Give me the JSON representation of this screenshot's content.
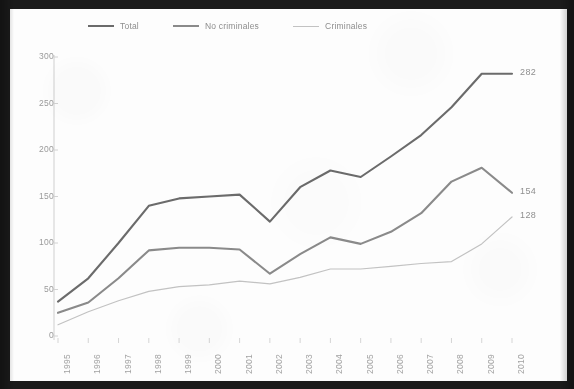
{
  "chart_data": {
    "type": "line",
    "title": "",
    "subtitle": "",
    "xlabel": "",
    "ylabel": "",
    "xlim": [
      1995,
      2010
    ],
    "ylim": [
      0,
      300
    ],
    "yticks": [
      0,
      50,
      100,
      150,
      200,
      250,
      300
    ],
    "grid": false,
    "legend_position": "top",
    "categories": [
      "1995",
      "1996",
      "1997",
      "1998",
      "1999",
      "2000",
      "2001",
      "2002",
      "2003",
      "2004",
      "2005",
      "2006",
      "2007",
      "2008",
      "2009",
      "2010"
    ],
    "series": [
      {
        "name": "Total",
        "color": "#6b6b6b",
        "end_label": "282",
        "values": [
          37,
          62,
          100,
          140,
          148,
          150,
          152,
          123,
          160,
          178,
          171,
          193,
          216,
          246,
          282,
          282
        ]
      },
      {
        "name": "No criminales",
        "color": "#8a8a8a",
        "end_label": "154",
        "values": [
          25,
          36,
          62,
          92,
          95,
          95,
          93,
          67,
          88,
          106,
          99,
          112,
          132,
          166,
          181,
          154
        ]
      },
      {
        "name": "Criminales",
        "color": "#c2c2c2",
        "end_label": "128",
        "values": [
          12,
          26,
          38,
          48,
          53,
          55,
          59,
          56,
          63,
          72,
          72,
          75,
          78,
          80,
          99,
          128
        ]
      }
    ],
    "annotations": [
      {
        "text": "282",
        "series": "Total",
        "at": "2010"
      },
      {
        "text": "154",
        "series": "No criminales",
        "at": "2010"
      },
      {
        "text": "128",
        "series": "Criminales",
        "at": "2010"
      }
    ]
  },
  "legend": {
    "items": [
      {
        "label": "Total"
      },
      {
        "label": "No criminales"
      },
      {
        "label": "Criminales"
      }
    ]
  },
  "axes": {
    "y": {
      "ticks": [
        "300",
        "250",
        "200",
        "150",
        "100",
        "50",
        "0"
      ]
    },
    "x": {
      "ticks": [
        "1995",
        "1996",
        "1997",
        "1998",
        "1999",
        "2000",
        "2001",
        "2002",
        "2003",
        "2004",
        "2005",
        "2006",
        "2007",
        "2008",
        "2009",
        "2010"
      ]
    }
  }
}
